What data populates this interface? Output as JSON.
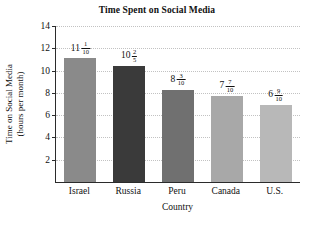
{
  "chart_data": {
    "type": "bar",
    "title": "Time Spent on Social Media",
    "xlabel": "Country",
    "ylabel_line1": "Time on Social Media",
    "ylabel_line2": "(hours per month)",
    "categories": [
      "Israel",
      "Russia",
      "Peru",
      "Canada",
      "U.S."
    ],
    "values": [
      11.1,
      10.4,
      8.3,
      7.7,
      6.9
    ],
    "value_labels": [
      {
        "whole": "11",
        "num": "1",
        "den": "10"
      },
      {
        "whole": "10",
        "num": "2",
        "den": "5"
      },
      {
        "whole": "8",
        "num": "3",
        "den": "10"
      },
      {
        "whole": "7",
        "num": "7",
        "den": "10"
      },
      {
        "whole": "6",
        "num": "9",
        "den": "10"
      }
    ],
    "bar_colors": [
      "#8a8a8a",
      "#3a3a3a",
      "#707070",
      "#a8a8a8",
      "#b8b8b8"
    ],
    "ylim": [
      0,
      14
    ],
    "yticks": [
      2,
      4,
      6,
      8,
      10,
      12,
      14
    ],
    "ytick_labels": [
      "2",
      "4",
      "6",
      "8",
      "10",
      "12",
      "14"
    ],
    "grid": true,
    "legend": "none"
  }
}
